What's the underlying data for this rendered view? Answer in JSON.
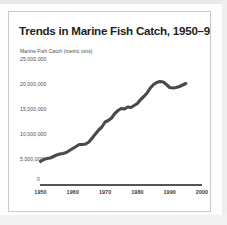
{
  "figure": {
    "title": "Trends in Marine Fish Catch, 1950–95",
    "axis_caption": "Marine Fish Catch (metric tons)",
    "origin_label": "0",
    "line_color": "#4a4a4a",
    "axis_color": "#555555",
    "border_color": "#c9c9c9",
    "background": "#ffffff"
  },
  "chart_data": {
    "type": "line",
    "title": "Trends in Marine Fish Catch, 1950–95",
    "xlabel": "",
    "ylabel": "Marine Fish Catch (metric tons)",
    "xlim": [
      1950,
      2000
    ],
    "ylim": [
      0,
      25000000
    ],
    "grid": false,
    "legend": "none",
    "ytick_labels": [
      "25,000,000",
      "20,000,000",
      "15,000,000",
      "10,000,000",
      "5,000,000"
    ],
    "ytick_values": [
      25000000,
      20000000,
      15000000,
      10000000,
      5000000
    ],
    "xtick_labels": [
      "1950",
      "1960",
      "1970",
      "1980",
      "1990",
      "2000"
    ],
    "xtick_values": [
      1950,
      1960,
      1970,
      1980,
      1990,
      2000
    ],
    "series": [
      {
        "name": "Marine fish catch",
        "x": [
          1950,
          1951,
          1952,
          1953,
          1954,
          1955,
          1956,
          1957,
          1958,
          1959,
          1960,
          1961,
          1962,
          1963,
          1964,
          1965,
          1966,
          1967,
          1968,
          1969,
          1970,
          1971,
          1972,
          1973,
          1974,
          1975,
          1976,
          1977,
          1978,
          1979,
          1980,
          1981,
          1982,
          1983,
          1984,
          1985,
          1986,
          1987,
          1988,
          1989,
          1990,
          1991,
          1992,
          1993,
          1994,
          1995
        ],
        "values": [
          4500000,
          4900000,
          5100000,
          5200000,
          5500000,
          5800000,
          6000000,
          6100000,
          6300000,
          6700000,
          7100000,
          7500000,
          7900000,
          7900000,
          8000000,
          8400000,
          9200000,
          10000000,
          10800000,
          11400000,
          12400000,
          12700000,
          13200000,
          14100000,
          14700000,
          15100000,
          15000000,
          15400000,
          15300000,
          15700000,
          16100000,
          16900000,
          17500000,
          18200000,
          19200000,
          19900000,
          20300000,
          20500000,
          20400000,
          19900000,
          19300000,
          19200000,
          19300000,
          19500000,
          19800000,
          20100000
        ]
      }
    ]
  }
}
